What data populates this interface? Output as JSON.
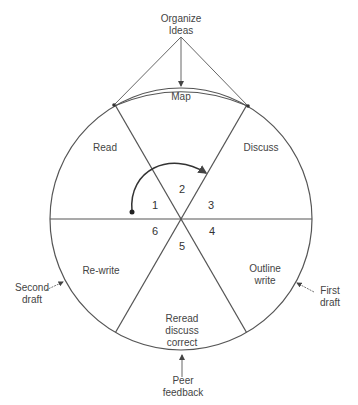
{
  "diagram": {
    "top_label": [
      "Organize",
      "Ideas"
    ],
    "sectors": [
      {
        "number": "1",
        "label": [
          "Read"
        ]
      },
      {
        "number": "2",
        "label": [
          "Map"
        ]
      },
      {
        "number": "3",
        "label": [
          "Discuss"
        ]
      },
      {
        "number": "4",
        "label": [
          "Outline",
          "write"
        ]
      },
      {
        "number": "5",
        "label": [
          "Reread",
          "discuss",
          "correct"
        ]
      },
      {
        "number": "6",
        "label": [
          "Re-write"
        ]
      }
    ],
    "outer_labels": {
      "first_draft": [
        "First",
        "draft"
      ],
      "second_draft": [
        "Second",
        "draft"
      ],
      "peer_feedback": [
        "Peer",
        "feedback"
      ]
    },
    "colors": {
      "line": "#555555",
      "text": "#444444",
      "background": "#ffffff"
    }
  }
}
